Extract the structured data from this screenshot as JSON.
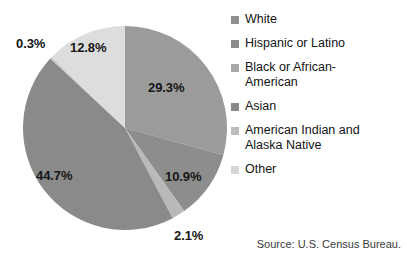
{
  "chart_data": {
    "type": "pie",
    "title": "",
    "legend_position": "right",
    "labels": [
      "White",
      "Hispanic or Latino",
      "Black or African-\nAmerican",
      "Asian",
      "American Indian and\nAlaska Native",
      "Other"
    ],
    "values": [
      29.3,
      10.9,
      2.1,
      44.7,
      0.3,
      12.8
    ],
    "value_labels": [
      "29.3%",
      "10.9%",
      "2.1%",
      "44.7%",
      "0.3%",
      "12.8%"
    ],
    "colors": [
      "#9b9b9b",
      "#8d8d8d",
      "#b9b9b9",
      "#8a8a8a",
      "#c6c6c6",
      "#dddddd"
    ],
    "source": "Source: U.S. Census Bureau."
  },
  "legend": {
    "items": [
      {
        "label": "White",
        "color": "#8f8f8f"
      },
      {
        "label": "Hispanic or Latino",
        "color": "#8a8a8a"
      },
      {
        "label": "Black or African-\nAmerican",
        "color": "#a8a8a8"
      },
      {
        "label": "Asian",
        "color": "#888888"
      },
      {
        "label": "American Indian and\nAlaska Native",
        "color": "#bdbdbd"
      },
      {
        "label": "Other",
        "color": "#d6d6d6"
      }
    ]
  },
  "slice_labels": [
    {
      "text": "29.3%",
      "left": 148,
      "top": 80
    },
    {
      "text": "10.9%",
      "left": 165,
      "top": 169
    },
    {
      "text": "2.1%",
      "left": 174,
      "top": 228
    },
    {
      "text": "44.7%",
      "left": 36,
      "top": 168
    },
    {
      "text": "0.3%",
      "left": 16,
      "top": 36
    },
    {
      "text": "12.8%",
      "left": 70,
      "top": 40
    }
  ],
  "source_note": "Source: U.S. Census Bureau."
}
